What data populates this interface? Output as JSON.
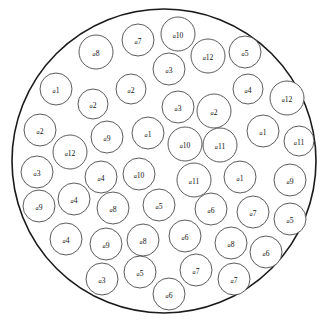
{
  "figure": {
    "name": "circle-packing-diagram",
    "container": {
      "cx": 164,
      "cy": 161,
      "r": 152
    },
    "label_prefix": "a",
    "stroke_color": "#4a4a4a",
    "container_stroke_color": "#1a1a1a",
    "fill_color": "#ffffff"
  },
  "chart_data": {
    "type": "scatter",
    "title": "",
    "xlabel": "",
    "ylabel": "",
    "xlim": [
      12,
      316
    ],
    "ylim": [
      9,
      313
    ],
    "grid": false,
    "legend": "none",
    "annotations": "Packed circles of varying radii inside one large bounding circle; each small circle is labelled with an italic prefix 'a' followed by an index 1-12.",
    "container_circle": {
      "cx": 164,
      "cy": 161,
      "r": 152
    },
    "circles": [
      {
        "id": 1,
        "label": "a10",
        "index": 10,
        "cx": 178,
        "cy": 34,
        "r": 17
      },
      {
        "id": 2,
        "label": "a7",
        "index": 7,
        "cx": 138,
        "cy": 40,
        "r": 16
      },
      {
        "id": 3,
        "label": "a8",
        "index": 8,
        "cx": 96,
        "cy": 52,
        "r": 17
      },
      {
        "id": 4,
        "label": "a5",
        "index": 5,
        "cx": 245,
        "cy": 52,
        "r": 16
      },
      {
        "id": 5,
        "label": "a12",
        "index": 12,
        "cx": 208,
        "cy": 56,
        "r": 17
      },
      {
        "id": 6,
        "label": "a3",
        "index": 3,
        "cx": 169,
        "cy": 69,
        "r": 16
      },
      {
        "id": 7,
        "label": "a1",
        "index": 1,
        "cx": 56,
        "cy": 89,
        "r": 16
      },
      {
        "id": 8,
        "label": "a2",
        "index": 2,
        "cx": 131,
        "cy": 89,
        "r": 15
      },
      {
        "id": 9,
        "label": "a4",
        "index": 4,
        "cx": 248,
        "cy": 89,
        "r": 15
      },
      {
        "id": 10,
        "label": "a12",
        "index": 12,
        "cx": 287,
        "cy": 98,
        "r": 17
      },
      {
        "id": 11,
        "label": "a2",
        "index": 2,
        "cx": 93,
        "cy": 104,
        "r": 15
      },
      {
        "id": 12,
        "label": "a3",
        "index": 3,
        "cx": 178,
        "cy": 107,
        "r": 16
      },
      {
        "id": 13,
        "label": "a2",
        "index": 2,
        "cx": 214,
        "cy": 111,
        "r": 17
      },
      {
        "id": 14,
        "label": "a2",
        "index": 2,
        "cx": 40,
        "cy": 130,
        "r": 16
      },
      {
        "id": 15,
        "label": "a9",
        "index": 9,
        "cx": 107,
        "cy": 137,
        "r": 16
      },
      {
        "id": 16,
        "label": "a1",
        "index": 1,
        "cx": 148,
        "cy": 133,
        "r": 16
      },
      {
        "id": 17,
        "label": "a1",
        "index": 1,
        "cx": 263,
        "cy": 131,
        "r": 16
      },
      {
        "id": 18,
        "label": "a10",
        "index": 10,
        "cx": 185,
        "cy": 144,
        "r": 17
      },
      {
        "id": 19,
        "label": "a11",
        "index": 11,
        "cx": 220,
        "cy": 145,
        "r": 17
      },
      {
        "id": 20,
        "label": "a11",
        "index": 11,
        "cx": 299,
        "cy": 141,
        "r": 15
      },
      {
        "id": 21,
        "label": "a12",
        "index": 12,
        "cx": 70,
        "cy": 152,
        "r": 17
      },
      {
        "id": 22,
        "label": "a3",
        "index": 3,
        "cx": 37,
        "cy": 172,
        "r": 16
      },
      {
        "id": 23,
        "label": "a4",
        "index": 4,
        "cx": 101,
        "cy": 177,
        "r": 16
      },
      {
        "id": 24,
        "label": "a10",
        "index": 10,
        "cx": 139,
        "cy": 174,
        "r": 16
      },
      {
        "id": 25,
        "label": "a11",
        "index": 11,
        "cx": 194,
        "cy": 180,
        "r": 17
      },
      {
        "id": 26,
        "label": "a1",
        "index": 1,
        "cx": 240,
        "cy": 177,
        "r": 16
      },
      {
        "id": 27,
        "label": "a9",
        "index": 9,
        "cx": 290,
        "cy": 180,
        "r": 16
      },
      {
        "id": 28,
        "label": "a4",
        "index": 4,
        "cx": 74,
        "cy": 199,
        "r": 16
      },
      {
        "id": 29,
        "label": "a9",
        "index": 9,
        "cx": 39,
        "cy": 206,
        "r": 16
      },
      {
        "id": 30,
        "label": "a8",
        "index": 8,
        "cx": 113,
        "cy": 208,
        "r": 16
      },
      {
        "id": 31,
        "label": "a5",
        "index": 5,
        "cx": 159,
        "cy": 205,
        "r": 16
      },
      {
        "id": 32,
        "label": "a6",
        "index": 6,
        "cx": 211,
        "cy": 209,
        "r": 16
      },
      {
        "id": 33,
        "label": "a7",
        "index": 7,
        "cx": 253,
        "cy": 212,
        "r": 16
      },
      {
        "id": 34,
        "label": "a5",
        "index": 5,
        "cx": 290,
        "cy": 219,
        "r": 16
      },
      {
        "id": 35,
        "label": "a4",
        "index": 4,
        "cx": 66,
        "cy": 239,
        "r": 16
      },
      {
        "id": 36,
        "label": "a9",
        "index": 9,
        "cx": 106,
        "cy": 244,
        "r": 16
      },
      {
        "id": 37,
        "label": "a8",
        "index": 8,
        "cx": 143,
        "cy": 240,
        "r": 16
      },
      {
        "id": 38,
        "label": "a6",
        "index": 6,
        "cx": 185,
        "cy": 236,
        "r": 16
      },
      {
        "id": 39,
        "label": "a8",
        "index": 8,
        "cx": 231,
        "cy": 243,
        "r": 16
      },
      {
        "id": 40,
        "label": "a6",
        "index": 6,
        "cx": 266,
        "cy": 252,
        "r": 16
      },
      {
        "id": 41,
        "label": "a3",
        "index": 3,
        "cx": 102,
        "cy": 279,
        "r": 16
      },
      {
        "id": 42,
        "label": "a5",
        "index": 5,
        "cx": 140,
        "cy": 272,
        "r": 16
      },
      {
        "id": 43,
        "label": "a6",
        "index": 6,
        "cx": 169,
        "cy": 294,
        "r": 16
      },
      {
        "id": 44,
        "label": "a7",
        "index": 7,
        "cx": 196,
        "cy": 270,
        "r": 16
      },
      {
        "id": 45,
        "label": "a7",
        "index": 7,
        "cx": 234,
        "cy": 279,
        "r": 16
      }
    ]
  }
}
